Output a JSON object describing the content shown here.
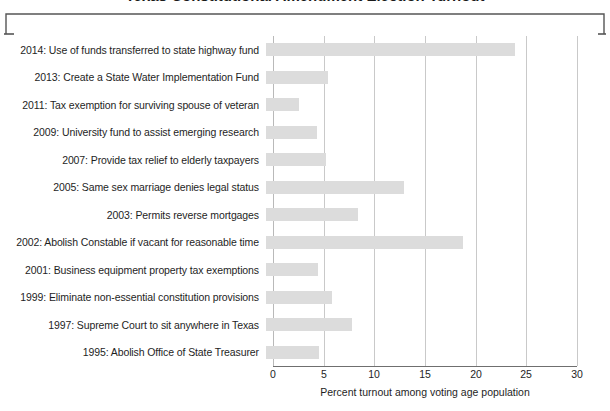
{
  "figure": {
    "title_cropped": "Texas Constitutional Amendment Election Turnout",
    "axis_label": "Percent turnout among voting age population",
    "bar_color": "#dcdcdc",
    "gridline_color": "#c9c9c9",
    "axis_color": "#6f6f6f"
  },
  "chart_data": {
    "type": "bar",
    "orientation": "horizontal",
    "title": "Texas Constitutional Amendment Election Turnout",
    "xlabel": "Percent turnout among voting age population",
    "ylabel": "",
    "xlim": [
      0,
      30
    ],
    "xticks": [
      0,
      5,
      10,
      15,
      20,
      25,
      30
    ],
    "xtick_labels": [
      "0",
      "5",
      "10",
      "15",
      "20",
      "25",
      "30"
    ],
    "grid": true,
    "legend": false,
    "categories": [
      "2014: Use of funds transferred to state highway fund",
      "2013: Create a State Water Implementation Fund",
      "2011: Tax exemption for surviving spouse of veteran",
      "2009: University fund to assist emerging research",
      "2007: Provide tax relief to elderly taxpayers",
      "2005: Same sex marriage denies legal status",
      "2003: Permits reverse mortgages",
      "2002: Abolish Constable if vacant for reasonable time",
      "2001: Business equipment property tax exemptions",
      "1999: Eliminate non-essential constitution provisions",
      "1997: Supreme Court to sit anywhere in Texas",
      "1995: Abolish Office of State Treasurer"
    ],
    "values": [
      24.6,
      6.1,
      3.3,
      5.0,
      5.9,
      13.6,
      9.1,
      19.4,
      5.1,
      6.5,
      8.5,
      5.2
    ]
  }
}
